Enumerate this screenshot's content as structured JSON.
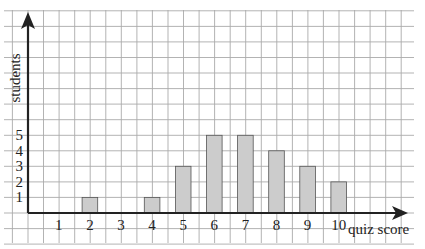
{
  "chart_data": {
    "type": "bar",
    "title": "",
    "xlabel": "quiz score",
    "ylabel": "students",
    "categories": [
      "1",
      "2",
      "3",
      "4",
      "5",
      "6",
      "7",
      "8",
      "9",
      "10"
    ],
    "values": [
      0,
      1,
      0,
      1,
      3,
      5,
      5,
      4,
      3,
      2
    ],
    "y_ticks": [
      "1",
      "2",
      "3",
      "4",
      "5"
    ],
    "ylim": [
      0,
      12
    ],
    "xlim": [
      0,
      12
    ],
    "grid": true,
    "bar_color": "#cccccc",
    "bar_edge_color": "#555555",
    "grid_color": "#aaaaaa",
    "axis_color": "#222222"
  }
}
